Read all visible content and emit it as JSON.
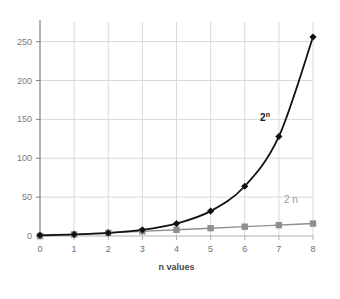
{
  "chart_data": {
    "type": "line",
    "title": "",
    "subtitle": "",
    "xlabel": "n values",
    "ylabel": "",
    "x": [
      0,
      1,
      2,
      3,
      4,
      5,
      6,
      7,
      8
    ],
    "xtick_labels": [
      "0",
      "1",
      "2",
      "3",
      "4",
      "5",
      "6",
      "7",
      "8"
    ],
    "ytick_labels": [
      "0",
      "50",
      "100",
      "150",
      "200",
      "250"
    ],
    "ytick_values": [
      0,
      50,
      100,
      150,
      200,
      250
    ],
    "xlim": [
      0,
      8
    ],
    "ylim": [
      0,
      265
    ],
    "grid": true,
    "legend_position": "inline-annotation",
    "series": [
      {
        "name": "2^n",
        "label": "2",
        "label_superscript": "n",
        "label_x": 6.45,
        "label_y": 148,
        "color": "#111111",
        "marker": "diamond",
        "values": [
          1,
          2,
          4,
          8,
          16,
          32,
          64,
          128,
          256
        ]
      },
      {
        "name": "2 n",
        "label": "2 n",
        "label_superscript": "",
        "label_x": 7.15,
        "label_y": 43,
        "color": "#8f8f8f",
        "marker": "square",
        "values": [
          0,
          2,
          4,
          6,
          8,
          10,
          12,
          14,
          16
        ]
      }
    ]
  },
  "colors": {
    "background": "#ffffff",
    "gridline": "#d9d9d9",
    "axis": "#808080",
    "series_exponential": "#111111",
    "series_linear": "#8f8f8f",
    "tick_label": "#7a7a7a",
    "axis_label": "#4a4a4a"
  }
}
